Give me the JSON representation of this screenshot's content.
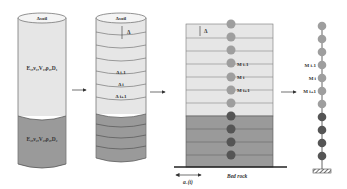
{
  "diagram": {
    "colors": {
      "upper_layer": "#e4e4e4",
      "lower_layer": "#9a9a9a",
      "light_mass": "#9e9e9e",
      "dark_mass": "#555555",
      "outline": "#555555"
    },
    "panel1": {
      "top_label": "Δsoil",
      "upper_layer_label": "E₁,ν₁,V₁,ρ₁,D₁",
      "lower_layer_label": "E₂,ν₂,V₂,ρ₂,D₂"
    },
    "panel2": {
      "top_label": "Δsoil",
      "thickness_label": "Δ",
      "sublayers": [
        "Δ i-1",
        "Δ i",
        "Δ i+1"
      ]
    },
    "panel3": {
      "thickness_label": "Δ",
      "mass_labels": [
        "M i-1",
        "M i",
        "M i+1"
      ],
      "base_label": "Bed rock",
      "excitation_label": "aₓ(t)"
    },
    "panel4": {
      "mass_labels": [
        "M i-1",
        "M i",
        "M i+1"
      ]
    },
    "arrows": [
      "panel1-to-panel2",
      "panel2-to-panel3",
      "panel3-to-panel4"
    ]
  }
}
